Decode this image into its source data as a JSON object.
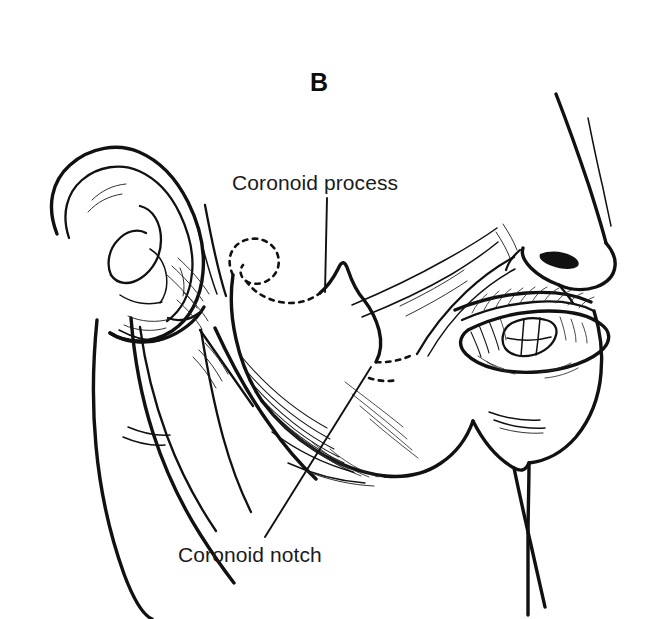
{
  "figure": {
    "panel_letter": "B",
    "domain": "anatomical-line-illustration",
    "background_color": "#ffffff",
    "ink_color": "#111111"
  },
  "labels": [
    {
      "id": "coronoid-process",
      "text": "Coronoid process",
      "x": 232,
      "y": 172,
      "leader": "vertical line descending from below the text to the bony peak"
    },
    {
      "id": "coronoid-notch",
      "text": "Coronoid notch",
      "x": 178,
      "y": 544,
      "leader": "long diagonal line ascending to the right toward the notch"
    }
  ],
  "structures": [
    {
      "name": "auricle",
      "note": "external ear with helix, antihelix, concha, tragus and lobule"
    },
    {
      "name": "mandibular-ramus",
      "note": "broad flat bone body behind the cheek"
    },
    {
      "name": "coronoid-process",
      "note": "anterior triangular peak of the ramus"
    },
    {
      "name": "mandibular-condyle",
      "note": "drawn as a dotted hidden outline behind the ramus"
    },
    {
      "name": "coronoid-notch",
      "note": "concave margin between condyle and coronoid process"
    },
    {
      "name": "nose",
      "note": "profile of nasal dorsum, tip and nostril"
    },
    {
      "name": "open-mouth",
      "note": "parted lips with maxillary teeth visible and dense shadow hatching"
    },
    {
      "name": "chin",
      "note": "mental prominence in profile"
    },
    {
      "name": "neck",
      "note": "sternocleidomastoid and anterior neck contours"
    }
  ],
  "icons": {
    "panel-letter-icon": "bold-capital-B",
    "leader-line-icon": "straight-pointer-line",
    "hidden-outline-icon": "dashed-contour"
  }
}
